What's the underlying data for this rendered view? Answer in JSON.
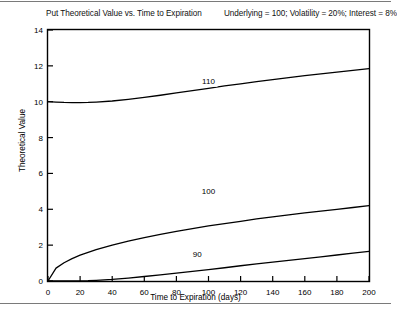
{
  "header": {
    "title": "Put Theoretical Value vs. Time to Expiration",
    "params": "Underlying = 100;  Volatility = 20%;  Interest = 8%"
  },
  "chart_data": {
    "type": "line",
    "title": "Put Theoretical Value vs. Time to Expiration",
    "subtitle": "Underlying = 100;  Volatility = 20%;  Interest = 8%",
    "xlabel": "Time to Expiration (days)",
    "ylabel": "Theoretical Value",
    "xlim": [
      0,
      200
    ],
    "ylim": [
      0,
      14
    ],
    "xticks": [
      0,
      20,
      40,
      60,
      80,
      100,
      120,
      140,
      160,
      180,
      200
    ],
    "yticks": [
      0,
      2,
      4,
      6,
      8,
      10,
      12,
      14
    ],
    "grid": false,
    "legend": "inline-curve-labels",
    "line_color": "#000000",
    "x": [
      0,
      5,
      10,
      15,
      20,
      25,
      30,
      40,
      50,
      60,
      70,
      80,
      90,
      100,
      110,
      120,
      130,
      140,
      150,
      160,
      170,
      180,
      190,
      200
    ],
    "series": [
      {
        "name": "110",
        "label": "110",
        "label_x": 100,
        "label_y": 11.0,
        "values": [
          10.0,
          9.98,
          9.96,
          9.95,
          9.95,
          9.96,
          9.98,
          10.04,
          10.13,
          10.24,
          10.36,
          10.49,
          10.62,
          10.75,
          10.88,
          11.0,
          11.12,
          11.23,
          11.34,
          11.45,
          11.55,
          11.65,
          11.75,
          11.85
        ]
      },
      {
        "name": "100",
        "label": "100",
        "label_x": 100,
        "label_y": 4.85,
        "values": [
          0.0,
          0.72,
          1.02,
          1.25,
          1.44,
          1.6,
          1.75,
          2.0,
          2.22,
          2.42,
          2.6,
          2.77,
          2.92,
          3.07,
          3.2,
          3.33,
          3.46,
          3.58,
          3.69,
          3.8,
          3.9,
          4.0,
          4.1,
          4.2
        ]
      },
      {
        "name": "90",
        "label": "90",
        "label_x": 93,
        "label_y": 1.35,
        "values": [
          0.0,
          0.0,
          0.0,
          0.0,
          0.01,
          0.02,
          0.04,
          0.09,
          0.16,
          0.25,
          0.34,
          0.44,
          0.54,
          0.64,
          0.74,
          0.85,
          0.95,
          1.05,
          1.15,
          1.25,
          1.35,
          1.45,
          1.55,
          1.65
        ]
      }
    ]
  },
  "axes": {
    "x_tick_labels": [
      "0",
      "20",
      "40",
      "60",
      "80",
      "100",
      "120",
      "140",
      "160",
      "180",
      "200"
    ],
    "y_tick_labels": [
      "0",
      "2",
      "4",
      "6",
      "8",
      "10",
      "12",
      "14"
    ]
  }
}
